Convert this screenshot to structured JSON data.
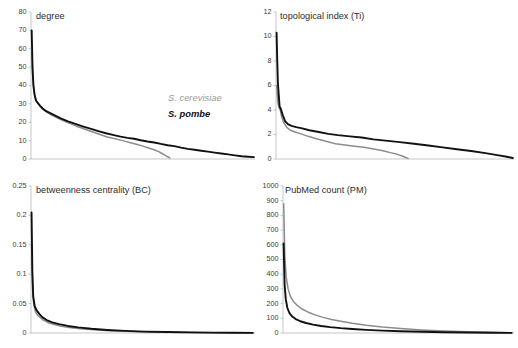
{
  "figure": {
    "legend": {
      "cerevisiae_label": "S. cerevisiae",
      "pombe_label": "S. pombe",
      "cerevisiae_color": "#8c8c8c",
      "pombe_color": "#111111"
    }
  },
  "chart_data": [
    {
      "id": "degree",
      "type": "line",
      "title": "degree",
      "xlabel": "",
      "ylabel": "",
      "ylim": [
        0,
        80
      ],
      "yticks": [
        0,
        10,
        20,
        30,
        40,
        50,
        60,
        70,
        80
      ],
      "ytick_labels": [
        "0",
        "10",
        "20",
        "30",
        "40",
        "50",
        "60",
        "70",
        "80"
      ],
      "xlim": [
        0,
        100
      ],
      "grid": false,
      "legend_position": "inside-right",
      "series": [
        {
          "name": "S. cerevisiae",
          "color": "#8c8c8c",
          "x": [
            0.4,
            0.8,
            1.2,
            1.8,
            2.4,
            3.2,
            4.2,
            5.4,
            7.0,
            9.0,
            11.5,
            14.0,
            17.0,
            20.0,
            23.5,
            27.0,
            30.5,
            34.0,
            37.5,
            41.0,
            44.0,
            47.0,
            50.0,
            52.5,
            55.0,
            57.0,
            58.5,
            60.0,
            61.0,
            62.0
          ],
          "y": [
            58.0,
            44.0,
            38.0,
            34.0,
            31.5,
            30.2,
            28.5,
            27.0,
            25.5,
            24.0,
            22.5,
            21.0,
            19.5,
            18.0,
            16.5,
            15.0,
            13.5,
            12.0,
            11.0,
            10.0,
            9.0,
            8.0,
            7.0,
            6.0,
            5.0,
            4.0,
            3.0,
            2.0,
            1.2,
            0.6
          ]
        },
        {
          "name": "S. pombe",
          "color": "#111111",
          "x": [
            0.3,
            0.7,
            1.1,
            1.6,
            2.2,
            3.0,
            4.0,
            5.2,
            6.8,
            8.8,
            11.0,
            13.5,
            16.5,
            19.5,
            23.0,
            26.5,
            30.0,
            33.5,
            37.0,
            40.0,
            43.0,
            46.0,
            49.0,
            52.0,
            55.0,
            58.0,
            61.0,
            64.0,
            67.0,
            70.0,
            73.0,
            76.0,
            79.0,
            82.0,
            85.0,
            88.0,
            91.0,
            94.0,
            97.0,
            99.5
          ],
          "y": [
            70.0,
            49.0,
            40.0,
            35.0,
            32.0,
            30.5,
            29.0,
            27.5,
            26.0,
            24.8,
            23.5,
            22.0,
            20.5,
            19.2,
            17.8,
            16.5,
            15.2,
            14.0,
            13.0,
            12.2,
            11.5,
            11.0,
            10.2,
            9.5,
            9.0,
            8.2,
            7.5,
            7.0,
            6.2,
            5.5,
            5.0,
            4.5,
            4.0,
            3.5,
            3.0,
            2.5,
            2.0,
            1.5,
            1.2,
            1.0
          ]
        }
      ]
    },
    {
      "id": "topological-index",
      "type": "line",
      "title": "topological index (Ti)",
      "xlabel": "",
      "ylabel": "",
      "ylim": [
        0,
        12
      ],
      "yticks": [
        0,
        2,
        4,
        6,
        8,
        10,
        12
      ],
      "ytick_labels": [
        "0",
        "2",
        "4",
        "6",
        "8",
        "10",
        "12"
      ],
      "xlim": [
        0,
        100
      ],
      "grid": false,
      "legend_position": "none",
      "series": [
        {
          "name": "S. cerevisiae",
          "color": "#8c8c8c",
          "x": [
            0.3,
            0.6,
            0.9,
            1.3,
            1.8,
            2.4,
            3.2,
            4.5,
            6.0,
            8.0,
            10.5,
            13.5,
            17.0,
            21.0,
            25.0,
            29.0,
            33.0,
            37.0,
            41.0,
            45.0,
            48.0,
            51.0,
            53.0,
            54.5,
            55.5
          ],
          "y": [
            6.0,
            5.0,
            4.5,
            4.2,
            4.0,
            3.4,
            3.0,
            2.6,
            2.35,
            2.2,
            2.05,
            1.85,
            1.65,
            1.45,
            1.25,
            1.15,
            1.05,
            0.95,
            0.82,
            0.68,
            0.52,
            0.38,
            0.25,
            0.12,
            0.05
          ]
        },
        {
          "name": "S. pombe",
          "color": "#111111",
          "x": [
            0.25,
            0.5,
            0.8,
            1.1,
            1.5,
            2.0,
            2.8,
            3.8,
            5.0,
            6.5,
            8.5,
            11.0,
            14.0,
            18.0,
            22.0,
            26.0,
            31.0,
            36.0,
            41.0,
            46.0,
            52.0,
            58.0,
            64.0,
            70.0,
            76.0,
            82.0,
            88.0,
            93.0,
            97.0,
            99.5
          ],
          "y": [
            10.3,
            8.2,
            6.2,
            5.4,
            4.3,
            4.1,
            3.6,
            3.1,
            2.85,
            2.7,
            2.6,
            2.5,
            2.35,
            2.2,
            2.05,
            1.95,
            1.85,
            1.75,
            1.6,
            1.5,
            1.38,
            1.25,
            1.1,
            0.95,
            0.8,
            0.65,
            0.48,
            0.32,
            0.18,
            0.08
          ]
        }
      ]
    },
    {
      "id": "betweenness-centrality",
      "type": "line",
      "title": "betweenness centrality (BC)",
      "xlabel": "",
      "ylabel": "",
      "ylim": [
        0,
        0.25
      ],
      "yticks": [
        0,
        0.05,
        0.1,
        0.15,
        0.2,
        0.25
      ],
      "ytick_labels": [
        "0",
        "0.05",
        "0.1",
        "0.15",
        "0.2",
        "0.25"
      ],
      "xlim": [
        0,
        100
      ],
      "grid": false,
      "legend_position": "none",
      "series": [
        {
          "name": "S. cerevisiae",
          "color": "#8c8c8c",
          "x": [
            0.3,
            0.7,
            1.2,
            2.0,
            3.0,
            4.2,
            5.5,
            7.5,
            10.0,
            13.0,
            17.0,
            22.0,
            28.0,
            35.0,
            43.0,
            52.0,
            62.0,
            72.0,
            82.0,
            92.0,
            99.0
          ],
          "y": [
            0.15,
            0.075,
            0.05,
            0.036,
            0.03,
            0.026,
            0.022,
            0.018,
            0.015,
            0.012,
            0.0095,
            0.0072,
            0.0055,
            0.004,
            0.0028,
            0.0019,
            0.0012,
            0.0008,
            0.0005,
            0.0003,
            0.0002
          ]
        },
        {
          "name": "S. pombe",
          "color": "#111111",
          "x": [
            0.25,
            0.6,
            1.0,
            1.7,
            2.6,
            3.8,
            5.0,
            7.0,
            9.5,
            12.5,
            16.5,
            21.0,
            27.0,
            34.0,
            42.0,
            51.0,
            61.0,
            71.0,
            81.0,
            91.0,
            99.0
          ],
          "y": [
            0.205,
            0.105,
            0.062,
            0.045,
            0.038,
            0.032,
            0.027,
            0.022,
            0.018,
            0.015,
            0.012,
            0.0095,
            0.0072,
            0.0052,
            0.0036,
            0.0024,
            0.0016,
            0.001,
            0.0006,
            0.0004,
            0.0002
          ]
        }
      ]
    },
    {
      "id": "pubmed-count",
      "type": "line",
      "title": "PubMed count (PM)",
      "xlabel": "",
      "ylabel": "",
      "ylim": [
        0,
        1000
      ],
      "yticks": [
        0,
        100,
        200,
        300,
        400,
        500,
        600,
        700,
        800,
        900,
        1000
      ],
      "ytick_labels": [
        "0",
        "100",
        "200",
        "300",
        "400",
        "500",
        "600",
        "700",
        "800",
        "900",
        "1000"
      ],
      "xlim": [
        0,
        100
      ],
      "grid": false,
      "legend_position": "none",
      "series": [
        {
          "name": "S. cerevisiae",
          "color": "#8c8c8c",
          "x": [
            0.3,
            0.8,
            1.4,
            2.2,
            3.2,
            4.5,
            6.0,
            8.0,
            10.5,
            13.5,
            17.0,
            21.0,
            25.0,
            30.0,
            36.0,
            43.0,
            51.0,
            60.0,
            70.0,
            80.0,
            90.0,
            99.0
          ],
          "y": [
            880,
            520,
            380,
            300,
            250,
            215,
            190,
            165,
            145,
            125,
            108,
            92,
            80,
            66,
            52,
            40,
            30,
            21,
            14,
            9,
            5,
            2
          ]
        },
        {
          "name": "S. pombe",
          "color": "#111111",
          "x": [
            0.25,
            0.7,
            1.2,
            1.9,
            2.8,
            4.0,
            5.5,
            7.5,
            10.0,
            13.0,
            16.5,
            20.5,
            25.0,
            30.0,
            36.0,
            43.0,
            51.0,
            60.0,
            70.0,
            80.0,
            90.0,
            99.0
          ],
          "y": [
            610,
            330,
            230,
            170,
            135,
            112,
            95,
            80,
            68,
            57,
            48,
            40,
            33,
            27,
            21,
            16,
            12,
            8,
            5,
            3,
            2,
            1
          ]
        }
      ]
    }
  ]
}
